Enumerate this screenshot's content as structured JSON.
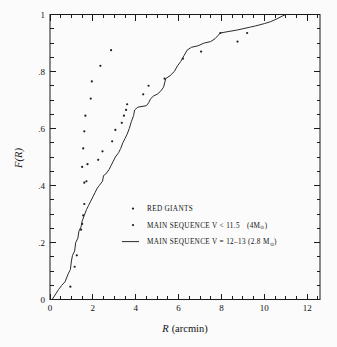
{
  "chart_data": {
    "type": "scatter",
    "title": "",
    "xlabel": "R (arcmin)",
    "xlabel_italic": "R",
    "xlabel_rest": "(arcmin)",
    "ylabel": "F(R)",
    "xlim": [
      0,
      12.6
    ],
    "ylim": [
      0,
      1
    ],
    "xticks": [
      0,
      2,
      4,
      6,
      8,
      10,
      12
    ],
    "xtick_labels": [
      "0",
      "2",
      "4",
      "6",
      "8",
      "10",
      "12"
    ],
    "yticks": [
      0,
      0.2,
      0.4,
      0.6,
      0.8,
      1
    ],
    "ytick_labels": [
      "0",
      ".2",
      ".4",
      ".6",
      ".8",
      "1"
    ],
    "x_minor_step": 0.5,
    "y_minor_step": 0.05,
    "grid": false,
    "legend_position": "center",
    "series": [
      {
        "name": "RED GIANTS",
        "marker": "dot",
        "points": [
          [
            0.95,
            0.045
          ],
          [
            1.15,
            0.115
          ],
          [
            1.25,
            0.155
          ],
          [
            1.45,
            0.245
          ],
          [
            1.5,
            0.265
          ],
          [
            1.55,
            0.295
          ],
          [
            1.6,
            0.335
          ],
          [
            1.6,
            0.41
          ],
          [
            1.7,
            0.415
          ],
          [
            1.5,
            0.465
          ],
          [
            1.55,
            0.53
          ],
          [
            1.6,
            0.59
          ],
          [
            1.65,
            0.645
          ],
          [
            1.9,
            0.705
          ],
          [
            1.95,
            0.765
          ],
          [
            2.35,
            0.82
          ],
          [
            2.85,
            0.875
          ]
        ]
      },
      {
        "name": "MAIN SEQUENCE V < 11.5   (4M⊙)",
        "marker": "dot",
        "points": [
          [
            1.75,
            0.475
          ],
          [
            2.25,
            0.49
          ],
          [
            2.45,
            0.52
          ],
          [
            2.9,
            0.555
          ],
          [
            3.05,
            0.595
          ],
          [
            3.35,
            0.62
          ],
          [
            3.45,
            0.645
          ],
          [
            3.55,
            0.665
          ],
          [
            3.6,
            0.685
          ],
          [
            4.35,
            0.72
          ],
          [
            4.6,
            0.75
          ],
          [
            5.35,
            0.775
          ],
          [
            6.2,
            0.845
          ],
          [
            7.05,
            0.87
          ],
          [
            7.95,
            0.935
          ],
          [
            8.75,
            0.905
          ],
          [
            9.2,
            0.935
          ]
        ]
      },
      {
        "name": "MAIN SEQUENCE V = 12-13 (2.8 M⊙)",
        "marker": "line",
        "points": [
          [
            0.1,
            0.0
          ],
          [
            0.4,
            0.035
          ],
          [
            0.55,
            0.05
          ],
          [
            0.7,
            0.062
          ],
          [
            0.85,
            0.09
          ],
          [
            0.95,
            0.105
          ],
          [
            1.0,
            0.135
          ],
          [
            1.05,
            0.155
          ],
          [
            1.15,
            0.17
          ],
          [
            1.2,
            0.2
          ],
          [
            1.3,
            0.215
          ],
          [
            1.35,
            0.24
          ],
          [
            1.45,
            0.255
          ],
          [
            1.5,
            0.275
          ],
          [
            1.6,
            0.295
          ],
          [
            1.7,
            0.315
          ],
          [
            1.8,
            0.33
          ],
          [
            1.9,
            0.345
          ],
          [
            2.0,
            0.36
          ],
          [
            2.1,
            0.375
          ],
          [
            2.2,
            0.39
          ],
          [
            2.3,
            0.4
          ],
          [
            2.45,
            0.415
          ],
          [
            2.5,
            0.435
          ],
          [
            2.6,
            0.44
          ],
          [
            2.75,
            0.455
          ],
          [
            2.85,
            0.47
          ],
          [
            2.95,
            0.485
          ],
          [
            3.05,
            0.5
          ],
          [
            3.2,
            0.515
          ],
          [
            3.3,
            0.53
          ],
          [
            3.4,
            0.55
          ],
          [
            3.5,
            0.565
          ],
          [
            3.6,
            0.58
          ],
          [
            3.7,
            0.6
          ],
          [
            3.8,
            0.625
          ],
          [
            3.9,
            0.645
          ],
          [
            3.95,
            0.665
          ],
          [
            4.1,
            0.675
          ],
          [
            4.5,
            0.68
          ],
          [
            4.6,
            0.69
          ],
          [
            4.7,
            0.705
          ],
          [
            4.85,
            0.715
          ],
          [
            5.0,
            0.72
          ],
          [
            5.15,
            0.73
          ],
          [
            5.3,
            0.745
          ],
          [
            5.4,
            0.775
          ],
          [
            5.6,
            0.785
          ],
          [
            5.8,
            0.8
          ],
          [
            5.95,
            0.82
          ],
          [
            6.1,
            0.835
          ],
          [
            6.25,
            0.855
          ],
          [
            6.4,
            0.875
          ],
          [
            6.6,
            0.885
          ],
          [
            6.9,
            0.89
          ],
          [
            7.2,
            0.9
          ],
          [
            7.5,
            0.905
          ],
          [
            7.7,
            0.915
          ],
          [
            7.95,
            0.935
          ],
          [
            8.3,
            0.94
          ],
          [
            8.7,
            0.945
          ],
          [
            9.0,
            0.95
          ],
          [
            9.3,
            0.955
          ],
          [
            9.6,
            0.96
          ],
          [
            10.0,
            0.968
          ],
          [
            10.3,
            0.975
          ],
          [
            10.6,
            0.985
          ],
          [
            10.85,
            0.995
          ],
          [
            11.0,
            1.0
          ]
        ]
      }
    ],
    "legend": [
      {
        "marker": "dot",
        "label": "RED GIANTS",
        "label_tail": "",
        "sub": ""
      },
      {
        "marker": "dot",
        "label": "MAIN SEQUENCE V < 11.5",
        "label_tail": "(4M",
        "sub": "⊙",
        "label_end": ")"
      },
      {
        "marker": "line",
        "label": "MAIN SEQUENCE V = 12–13 (2.8 M",
        "label_tail": "",
        "sub": "⊙",
        "label_end": ")"
      }
    ]
  }
}
